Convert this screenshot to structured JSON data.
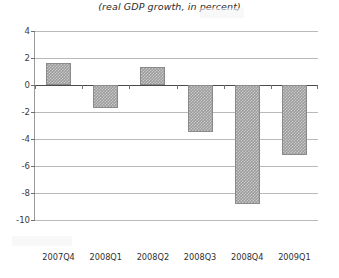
{
  "chart_data": {
    "type": "bar",
    "title": "(real GDP growth, in percent)",
    "xlabel": "",
    "ylabel": "",
    "categories": [
      "2007Q4",
      "2008Q1",
      "2008Q2",
      "2008Q3",
      "2008Q4",
      "2009Q1"
    ],
    "values": [
      1.6,
      -1.7,
      1.3,
      -3.5,
      -8.8,
      -5.2
    ],
    "series": [
      {
        "name": "real GDP growth",
        "values": [
          1.6,
          -1.7,
          1.3,
          -3.5,
          -8.8,
          -5.2
        ]
      }
    ],
    "ylim": [
      -10,
      4
    ],
    "ytick_labels": [
      "4",
      "2",
      "0",
      "-2",
      "-4",
      "-6",
      "-8",
      "-10"
    ],
    "ytick_values": [
      4,
      2,
      0,
      -2,
      -4,
      -6,
      -8,
      -10
    ],
    "grid": true,
    "legend": null,
    "bar_color": "#9d9d9d",
    "bar_pattern": "checkered",
    "axis_color": "#4a4a4a",
    "gridline_color": "#b9b9b9",
    "background_color": "#ffffff"
  }
}
